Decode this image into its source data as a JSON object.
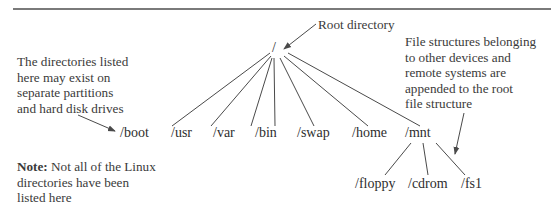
{
  "diagram": {
    "root": {
      "label": "/"
    },
    "level1": [
      "/boot",
      "/usr",
      "/var",
      "/bin",
      "/swap",
      "/home",
      "/mnt"
    ],
    "mnt_children": [
      "/floppy",
      "/cdrom",
      "/fs1"
    ],
    "annotations": {
      "root_directory": "Root directory",
      "partitions": [
        "The directories listed",
        "here may exist on",
        "separate partitions",
        "and hard disk drives"
      ],
      "file_structures": [
        "File structures belonging",
        "to other devices and",
        "remote systems are",
        "appended to the root",
        "file structure"
      ],
      "note_label": "Note:",
      "note_text": [
        " Not all of the Linux",
        "directories have been",
        "listed here"
      ]
    },
    "colors": {
      "line": "#4a4a4a",
      "rule": "#7a7a7a",
      "text": "#333333"
    }
  }
}
